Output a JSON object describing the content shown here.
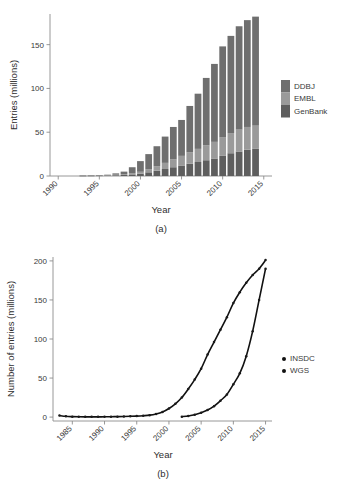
{
  "figure": {
    "background": "#ffffff",
    "panel_a_caption": "(a)",
    "panel_b_caption": "(b)"
  },
  "colors": {
    "ddbj": "#6f6f6f",
    "embl": "#9a9a9a",
    "genbank": "#5e5e5e",
    "axis": "#8c8c8c",
    "text": "#3a3a3a",
    "series": "#111111"
  },
  "chart_data": [
    {
      "type": "bar",
      "id": "panel-a",
      "title": "",
      "xlabel": "Year",
      "ylabel": "Entries (millions)",
      "stacked": true,
      "grid": false,
      "legend_position": "right",
      "xlim": [
        1989,
        2016
      ],
      "ylim": [
        0,
        185
      ],
      "xticks": [
        1990,
        1995,
        2000,
        2005,
        2010,
        2015
      ],
      "xticklabels": [
        "1990",
        "1995",
        "2000",
        "2005",
        "2010",
        "2015"
      ],
      "yticks": [
        0,
        50,
        100,
        150
      ],
      "yticklabels": [
        "0",
        "50",
        "100",
        "150"
      ],
      "categories": [
        1993,
        1994,
        1995,
        1996,
        1997,
        1998,
        1999,
        2000,
        2001,
        2002,
        2003,
        2004,
        2005,
        2006,
        2007,
        2008,
        2009,
        2010,
        2011,
        2012,
        2013,
        2014
      ],
      "series": [
        {
          "name": "GenBank",
          "color": "#5e5e5e",
          "values": [
            0.15,
            0.2,
            0.35,
            0.5,
            0.8,
            1.2,
            1.8,
            2.6,
            4.2,
            6.0,
            8.0,
            10.0,
            12.0,
            14.0,
            16.0,
            18.0,
            20.0,
            23.0,
            26.0,
            28.0,
            30.0,
            31.0
          ]
        },
        {
          "name": "EMBL",
          "color": "#9a9a9a",
          "values": [
            0.12,
            0.16,
            0.28,
            0.42,
            0.7,
            1.0,
            1.5,
            2.2,
            3.6,
            5.2,
            7.0,
            9.0,
            11.0,
            13.0,
            15.0,
            17.0,
            19.0,
            21.0,
            23.0,
            25.0,
            26.0,
            26.5
          ]
        },
        {
          "name": "DDBJ",
          "color": "#6f6f6f",
          "values": [
            0.13,
            0.14,
            0.27,
            0.58,
            1.5,
            2.8,
            6.7,
            12.2,
            17.2,
            22.8,
            30.0,
            37.0,
            41.0,
            53.0,
            63.0,
            77.0,
            89.0,
            104.0,
            111.0,
            118.0,
            122.0,
            124.5
          ]
        }
      ],
      "totals": [
        0.4,
        0.5,
        0.9,
        1.5,
        3.0,
        5.0,
        10.0,
        17.0,
        25.0,
        34.0,
        45.0,
        56.0,
        64.0,
        80.0,
        94.0,
        112.0,
        128.0,
        148.0,
        160.0,
        171.0,
        178.0,
        182.0
      ],
      "legend": [
        "DDBJ",
        "EMBL",
        "GenBank"
      ]
    },
    {
      "type": "line",
      "id": "panel-b",
      "title": "",
      "xlabel": "Year",
      "ylabel": "Number of entries (millions)",
      "grid": false,
      "legend_position": "right",
      "xlim": [
        1982,
        2016
      ],
      "ylim": [
        -5,
        205
      ],
      "xticks": [
        1985,
        1990,
        1995,
        2000,
        2005,
        2010,
        2015
      ],
      "xticklabels": [
        "1985",
        "1990",
        "1995",
        "2000",
        "2005",
        "2010",
        "2015"
      ],
      "yticks": [
        0,
        50,
        100,
        150,
        200
      ],
      "yticklabels": [
        "0",
        "50",
        "100",
        "150",
        "200"
      ],
      "series": [
        {
          "name": "INSDC",
          "marker": "dot",
          "color": "#111111",
          "x": [
            1983,
            1984,
            1985,
            1986,
            1987,
            1988,
            1989,
            1990,
            1991,
            1992,
            1993,
            1994,
            1995,
            1996,
            1997,
            1998,
            1999,
            2000,
            2001,
            2002,
            2003,
            2004,
            2005,
            2006,
            2007,
            2008,
            2009,
            2010,
            2011,
            2012,
            2013,
            2014,
            2015
          ],
          "y": [
            2.0,
            1.0,
            0.6,
            0.4,
            0.3,
            0.3,
            0.3,
            0.4,
            0.5,
            0.6,
            0.8,
            1.0,
            1.3,
            1.8,
            2.5,
            4.0,
            6.5,
            11.0,
            17.0,
            25.0,
            36.0,
            48.0,
            62.0,
            80.0,
            96.0,
            112.0,
            128.0,
            146.0,
            160.0,
            172.0,
            182.0,
            190.0,
            201.0
          ]
        },
        {
          "name": "WGS",
          "marker": "dot",
          "color": "#111111",
          "x": [
            2002,
            2003,
            2004,
            2005,
            2006,
            2007,
            2008,
            2009,
            2010,
            2011,
            2012,
            2013,
            2014,
            2015
          ],
          "y": [
            0.5,
            1.5,
            3.0,
            5.5,
            9.0,
            14.0,
            21.0,
            29.0,
            42.0,
            56.0,
            78.0,
            110.0,
            150.0,
            190.0
          ]
        }
      ],
      "legend": [
        "INSDC",
        "WGS"
      ]
    }
  ],
  "panel_a": {
    "ylabel": "Entries (millions)",
    "xlabel": "Year",
    "caption": "(a)",
    "yticklabels": [
      "0",
      "50",
      "100",
      "150"
    ],
    "xticklabels": [
      "1990",
      "1995",
      "2000",
      "2005",
      "2010",
      "2015"
    ],
    "legend": [
      {
        "label": "DDBJ",
        "color": "#6f6f6f"
      },
      {
        "label": "EMBL",
        "color": "#9a9a9a"
      },
      {
        "label": "GenBank",
        "color": "#5e5e5e"
      }
    ]
  },
  "panel_b": {
    "ylabel": "Number of entries (millions)",
    "xlabel": "Year",
    "caption": "(b)",
    "yticklabels": [
      "0",
      "50",
      "100",
      "150",
      "200"
    ],
    "xticklabels": [
      "1985",
      "1990",
      "1995",
      "2000",
      "2005",
      "2010",
      "2015"
    ],
    "legend": [
      {
        "label": "INSDC",
        "color": "#111111"
      },
      {
        "label": "WGS",
        "color": "#111111"
      }
    ]
  }
}
